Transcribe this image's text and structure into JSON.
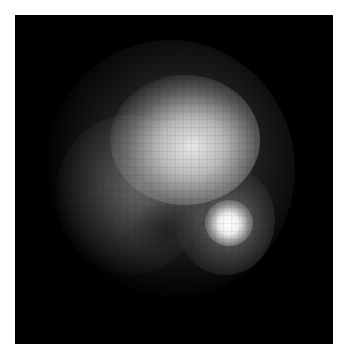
{
  "image": {
    "description": "Grayscale blurred pixelated bright blob on black square background with white border",
    "colors": {
      "background": "#000000",
      "border": "#ffffff",
      "core": "#f0f0f0",
      "hotspot": "#ffffff"
    },
    "regions": [
      {
        "name": "core",
        "center": [
          190,
          140
        ]
      },
      {
        "name": "left-lobe",
        "center": [
          130,
          200
        ]
      },
      {
        "name": "hotspot",
        "center": [
          228,
          225
        ]
      }
    ]
  }
}
